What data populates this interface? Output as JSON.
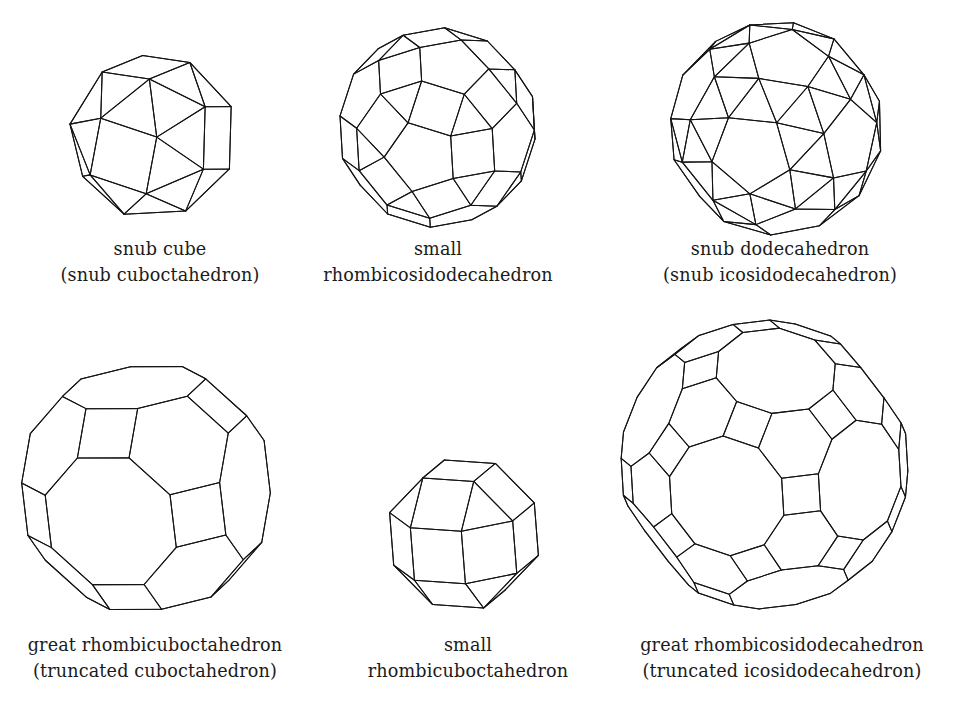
{
  "page": {
    "background_color": "#ffffff",
    "line_color": "#141414",
    "width": 975,
    "height": 712
  },
  "figures": [
    {
      "id": "snub-cube",
      "name": "snub cube",
      "caption_line1": "snub cube",
      "caption_line2": "(snub cuboctahedron)",
      "faces": "32 triangles, 6 squares"
    },
    {
      "id": "small-rhombicosidodecahedron",
      "name": "small rhombicosidodecahedron",
      "caption_line1": "small",
      "caption_line2": "rhombicosidodecahedron",
      "faces": "20 triangles, 30 squares, 12 pentagons"
    },
    {
      "id": "snub-dodecahedron",
      "name": "snub dodecahedron",
      "caption_line1": "snub dodecahedron",
      "caption_line2": "(snub icosidodecahedron)",
      "faces": "80 triangles, 12 pentagons"
    },
    {
      "id": "great-rhombicuboctahedron",
      "name": "great rhombicuboctahedron",
      "caption_line1": "great rhombicuboctahedron",
      "caption_line2": "(truncated cuboctahedron)",
      "faces": "12 squares, 8 hexagons, 6 octagons"
    },
    {
      "id": "small-rhombicuboctahedron",
      "name": "small rhombicuboctahedron",
      "caption_line1": "small",
      "caption_line2": "rhombicuboctahedron",
      "faces": "8 triangles, 18 squares"
    },
    {
      "id": "great-rhombicosidodecahedron",
      "name": "great rhombicosidodecahedron",
      "caption_line1": "great rhombicosidodecahedron",
      "caption_line2": "(truncated icosidodecahedron)",
      "faces": "30 squares, 20 hexagons, 12 decagons"
    }
  ]
}
